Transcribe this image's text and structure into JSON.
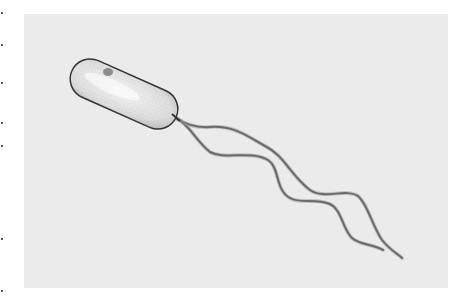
{
  "image": {
    "subject": "bacterium-with-flagella-illustration",
    "background_color": "#ebebeb",
    "outline_color": "#333333",
    "cell_fill_color": "#f2f2f2"
  }
}
